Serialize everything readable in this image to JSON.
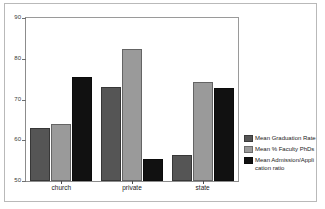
{
  "chart_data": {
    "type": "bar",
    "title": "",
    "subtitle": "",
    "xlabel": "",
    "ylabel": "",
    "categories": [
      "church",
      "private",
      "state"
    ],
    "series": [
      {
        "name": "Mean Graduation Rate",
        "color": "#555555",
        "values": [
          63,
          73,
          56.3
        ]
      },
      {
        "name": "Mean % Faculty PhDs",
        "color": "#9a9a9a",
        "values": [
          64,
          82.5,
          74.3
        ]
      },
      {
        "name": "Mean Admission/Appli cation ratio",
        "color": "#111111",
        "values": [
          75.5,
          55.5,
          72.8
        ]
      }
    ],
    "ylim": [
      50,
      90
    ],
    "yticks": [
      90,
      80,
      70,
      60,
      50
    ],
    "ytick_labels": [
      "90",
      "80",
      "70",
      "60",
      "50"
    ],
    "grid": false,
    "legend_position": "right",
    "legend_entries": [
      "Mean Graduation Rate",
      "Mean % Faculty PhDs",
      "Mean Admission/Appli cation ratio"
    ],
    "legend_entry_lines": [
      [
        "Mean Graduation Rate"
      ],
      [
        "Mean % Faculty PhDs"
      ],
      [
        "Mean Admission/Appli",
        "cation ratio"
      ]
    ],
    "colors": {
      "series1": "#555555",
      "series2": "#9a9a9a",
      "series3": "#111111",
      "background": "#ffffff",
      "axis": "#8c8c8c",
      "frame": "#b9b9b9"
    }
  }
}
